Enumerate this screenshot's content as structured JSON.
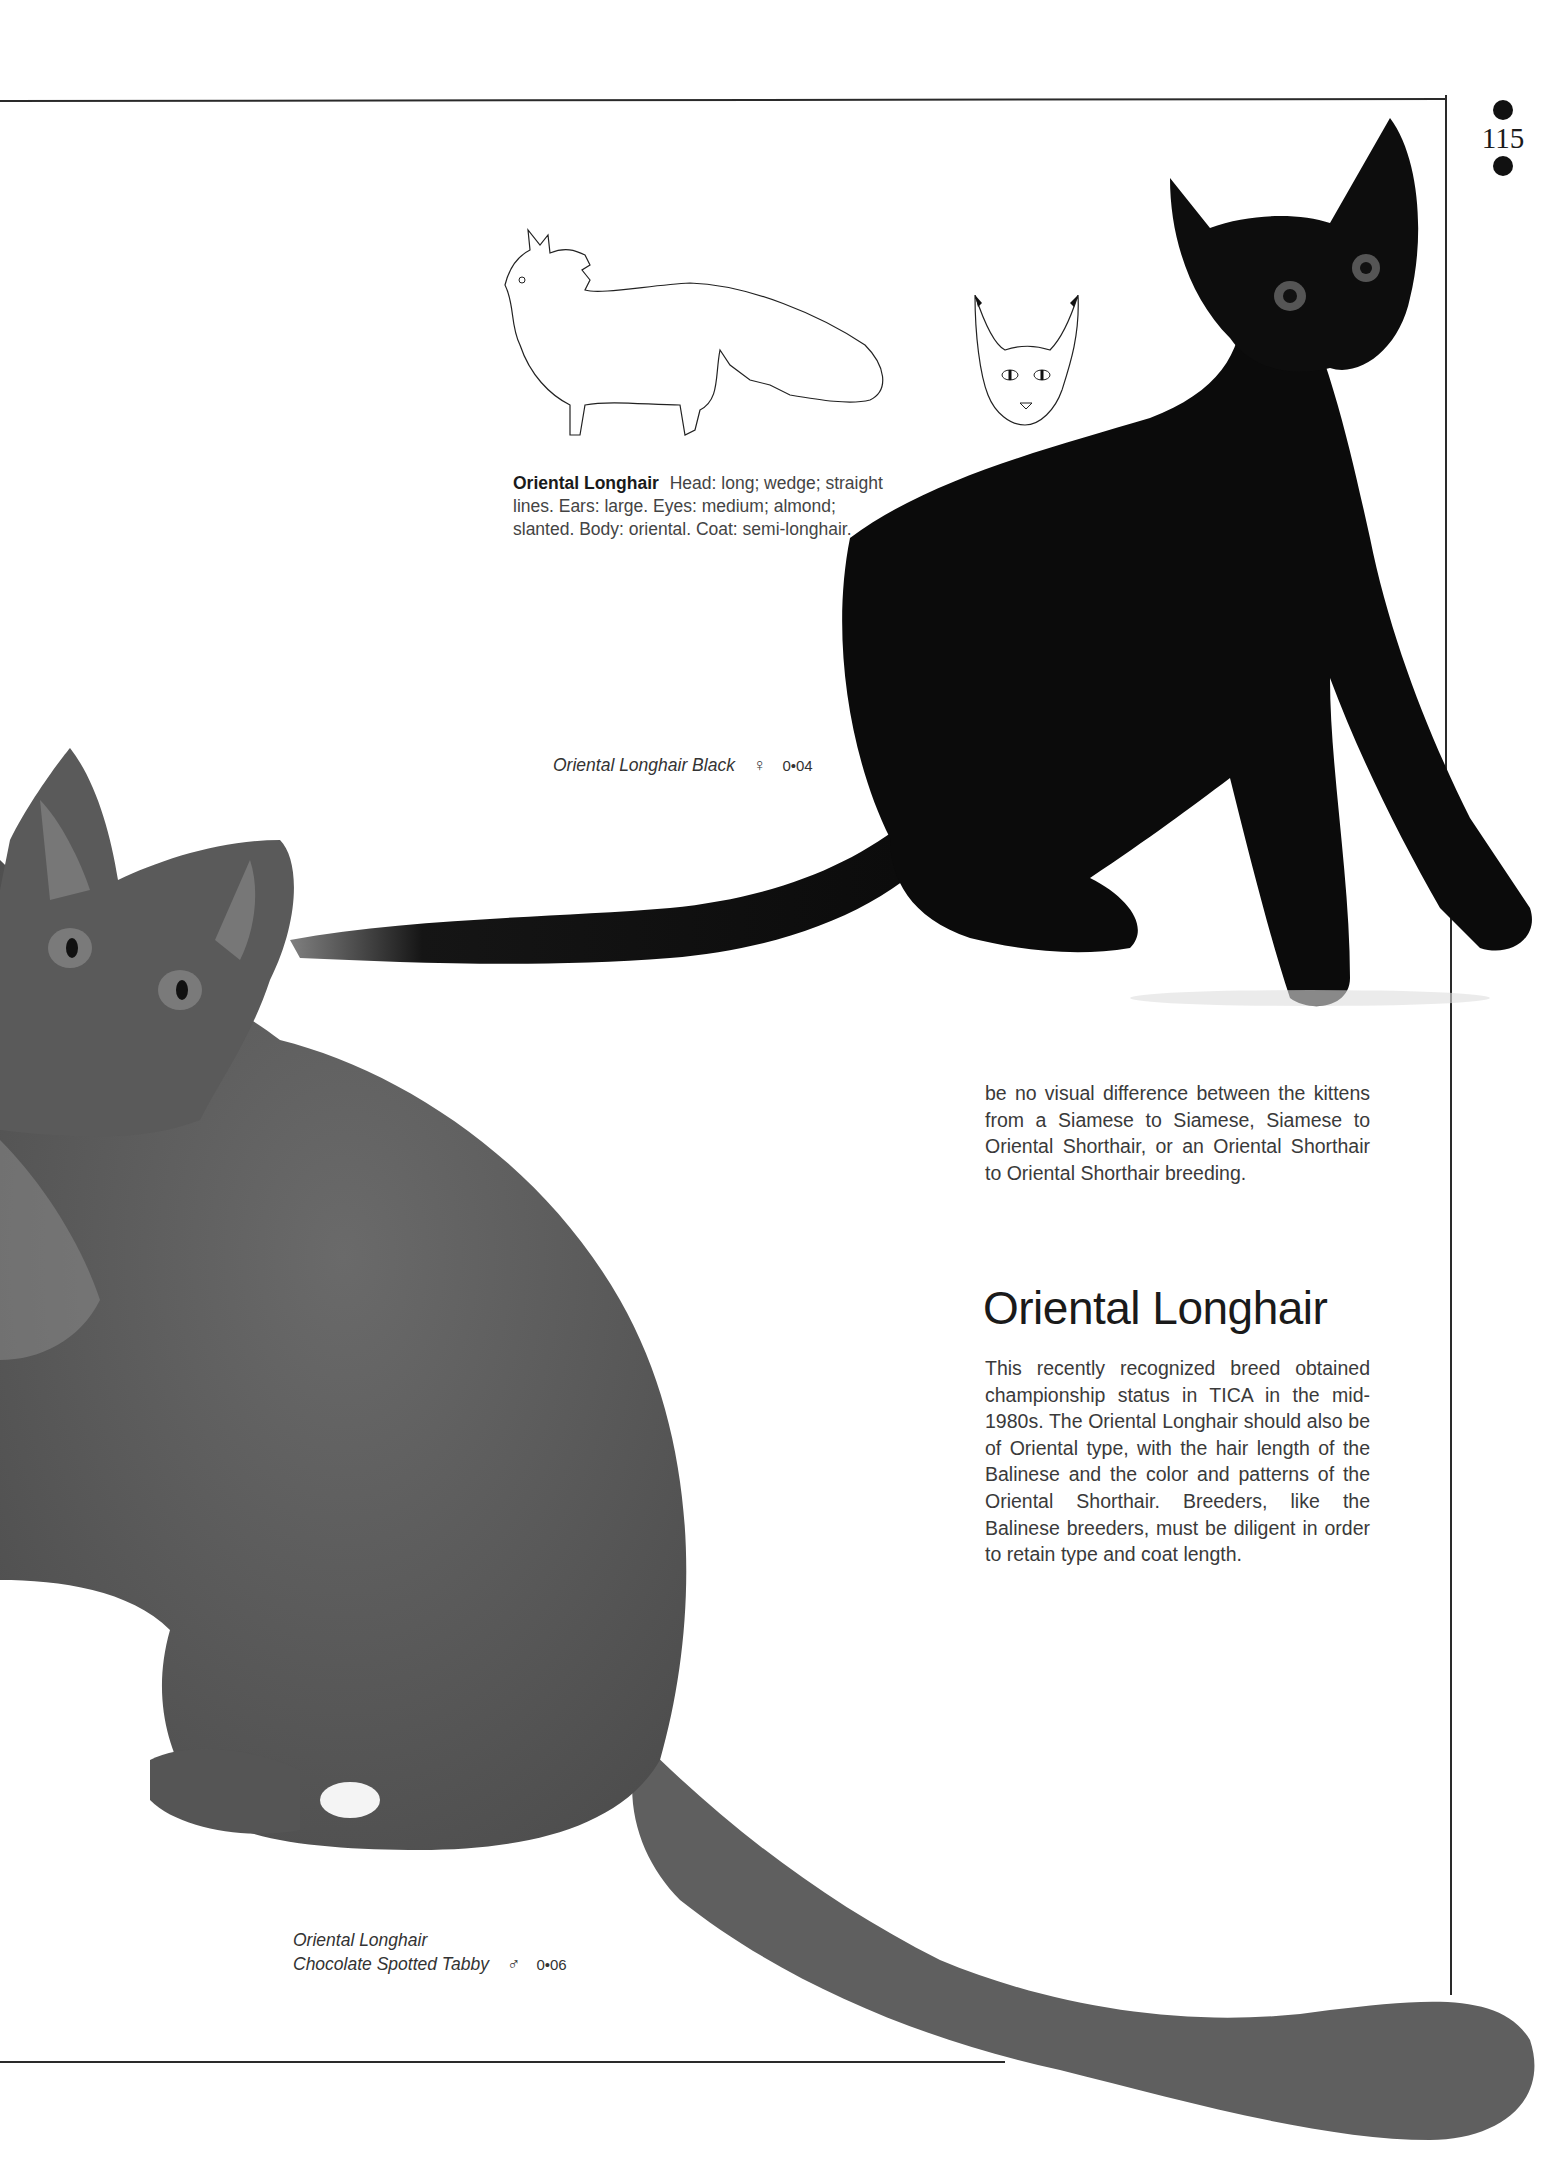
{
  "page": {
    "folio_number": "115",
    "folio_marks": [
      "bullet-top",
      "bullet-bottom"
    ]
  },
  "illustration": {
    "drawings": [
      {
        "subject": "Oriental Longhair full-body profile outline"
      },
      {
        "subject": "Oriental Longhair head front view outline"
      }
    ]
  },
  "breed_summary": {
    "name": "Oriental Longhair",
    "description": "Head: long; wedge; straight lines. Ears: large. Eyes: medium; almond; slanted. Body: oriental. Coat: semi-longhair."
  },
  "photos": [
    {
      "subject": "black Oriental Longhair kitten seated, looking up",
      "caption": {
        "lines": [
          "Oriental Longhair Black"
        ],
        "sex_symbol": "♀",
        "age_code": "0•04"
      }
    },
    {
      "subject": "chocolate spotted tabby Oriental Longhair seated, long plumed tail",
      "caption": {
        "lines": [
          "Oriental Longhair",
          "Chocolate Spotted Tabby"
        ],
        "sex_symbol": "♂",
        "age_code": "0•06"
      }
    }
  ],
  "article": {
    "continued_paragraph": "be no visual difference between the kittens from a Siamese to Siamese, Siamese to Oriental Shorthair, or an Oriental Shorthair to Oriental Shorthair breeding.",
    "section_heading": "Oriental Longhair",
    "section_paragraph": "This recently recognized breed obtained championship status in TICA in the mid-1980s. The Oriental Longhair should also be of Oriental type, with the hair length of the Balinese and the color and patterns of the Oriental Shorthair. Breeders, like the Balinese breeders, must be diligent in order to retain type and coat length."
  },
  "colors": {
    "rule": "#2a2a2a",
    "black_cat": "#0b0b0b",
    "tabby_cat": "#5e5e5e",
    "text": "#3a3a3a"
  }
}
